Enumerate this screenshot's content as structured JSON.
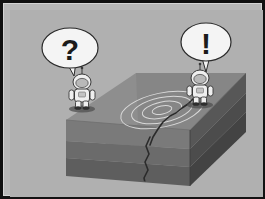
{
  "figure": {
    "domain_kind": "illustration",
    "frame_color": "#121212",
    "inner_border_color": "#d6d6d6",
    "background_color": "#b9b9b9"
  },
  "scene": {
    "sky": {
      "label": "background",
      "color": "#b0b0b0"
    },
    "ground_block": {
      "label": "ground block",
      "top_face_color": "#8e8e8e",
      "top_face_color_dark": "#7e7e7e",
      "front_face_colors": [
        "#7a7a7a",
        "#6b6b6b",
        "#5e5e5e"
      ],
      "side_face_colors": [
        "#575757",
        "#4c4c4c",
        "#434343"
      ],
      "strata_count": 3,
      "strata_labels": [
        "upper stratum",
        "middle stratum",
        "lower stratum"
      ]
    },
    "crack": {
      "label": "ground crack",
      "color": "#2b2b2b",
      "description": "fissure running from right figure across the top surface and down the front face"
    },
    "ripples": {
      "label": "seismic ripple rings",
      "color": "#d8d8d8",
      "ring_count": 4,
      "center_x": 152,
      "center_y": 100
    },
    "figures": [
      {
        "id": "left-figure",
        "name": "left astronaut",
        "x": 72,
        "y": 80,
        "suit_color": "#efefef",
        "shade_color": "#c3c3c3",
        "outline_color": "#3a3a3a",
        "bubble": {
          "id": "question-bubble",
          "name": "question speech bubble",
          "text": "?",
          "fill": "#f4f4f4",
          "outline": "#2a2a2a",
          "cx": 60,
          "cy": 38,
          "rx": 28,
          "ry": 20
        }
      },
      {
        "id": "right-figure",
        "name": "right astronaut",
        "x": 190,
        "y": 76,
        "suit_color": "#efefef",
        "shade_color": "#c3c3c3",
        "outline_color": "#3a3a3a",
        "bubble": {
          "id": "exclamation-bubble",
          "name": "exclamation speech bubble",
          "text": "!",
          "fill": "#f4f4f4",
          "outline": "#2a2a2a",
          "cx": 196,
          "cy": 32,
          "rx": 25,
          "ry": 19
        }
      }
    ]
  }
}
